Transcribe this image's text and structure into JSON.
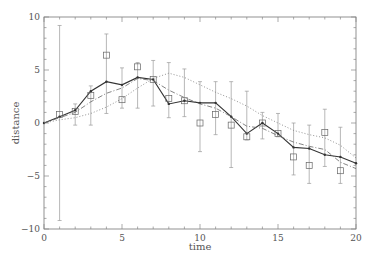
{
  "chart_data": {
    "type": "line",
    "title": "",
    "xlabel": "time",
    "ylabel": "distance",
    "xlim": [
      0,
      20
    ],
    "ylim": [
      -10,
      10
    ],
    "grid": false,
    "legend": null,
    "x_ticks": [
      0,
      5,
      10,
      15,
      20
    ],
    "y_ticks": [
      -10,
      -5,
      0,
      5,
      10
    ],
    "x_tick_labels": [
      "0",
      "5",
      "10",
      "15",
      "20"
    ],
    "y_tick_labels": [
      "-10",
      "-5",
      "0",
      "5",
      "10"
    ],
    "x": [
      0,
      1,
      2,
      3,
      4,
      5,
      6,
      7,
      8,
      9,
      10,
      11,
      12,
      13,
      14,
      15,
      16,
      17,
      18,
      19,
      20
    ],
    "observations": {
      "name": "measurements",
      "marker": "square",
      "t": [
        1,
        2,
        3,
        4,
        5,
        6,
        7,
        8,
        9,
        10,
        11,
        12,
        13,
        14,
        15,
        16,
        17,
        18,
        19
      ],
      "values": [
        0.8,
        1.1,
        2.6,
        6.4,
        2.2,
        5.3,
        4.1,
        2.3,
        2.1,
        0.0,
        0.8,
        -0.2,
        -1.3,
        0.0,
        -1.0,
        -3.2,
        -4.0,
        -0.9,
        -4.5
      ],
      "err_low": [
        -9.2,
        -0.2,
        -0.2,
        0.9,
        1.4,
        1.4,
        1.6,
        0.5,
        0.6,
        -2.7,
        -1.1,
        -4.2,
        -1.6,
        -1.5,
        -1.3,
        -4.9,
        -5.7,
        -4.1,
        -5.7
      ],
      "err_high": [
        9.2,
        1.8,
        3.5,
        8.4,
        5.2,
        5.7,
        5.9,
        5.7,
        5.1,
        3.9,
        3.9,
        3.9,
        3.0,
        1.0,
        0.9,
        0.0,
        -0.2,
        1.3,
        -0.4
      ]
    },
    "series": [
      {
        "name": "estimate",
        "style": "solid",
        "values": [
          0.0,
          0.6,
          1.2,
          3.0,
          3.9,
          3.6,
          4.3,
          4.1,
          1.8,
          2.1,
          1.9,
          1.9,
          0.6,
          -1.0,
          0.0,
          -1.0,
          -2.3,
          -2.4,
          -3.0,
          -3.2,
          -3.8
        ]
      },
      {
        "name": "smoothed",
        "style": "dashdot",
        "values": [
          0.0,
          0.5,
          1.0,
          2.0,
          2.8,
          3.3,
          4.2,
          4.0,
          3.1,
          2.4,
          1.8,
          1.4,
          0.6,
          -0.3,
          -0.5,
          -1.2,
          -1.8,
          -2.2,
          -2.5,
          -3.7,
          -4.3
        ]
      },
      {
        "name": "true",
        "style": "dotted",
        "values": [
          0.0,
          0.3,
          0.5,
          0.9,
          1.5,
          2.3,
          3.3,
          4.2,
          4.7,
          4.3,
          3.6,
          2.9,
          2.3,
          1.6,
          0.7,
          0.0,
          -0.7,
          -1.1,
          -1.4,
          -2.1,
          -3.3
        ]
      }
    ]
  }
}
